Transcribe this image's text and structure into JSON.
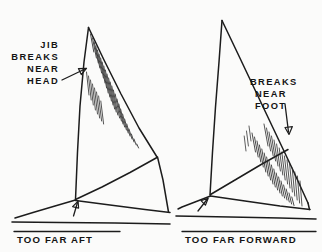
{
  "figure": {
    "background_color": "#fbfbfa",
    "ink_color": "#1c1c1c",
    "style": "hand-drawn line illustration"
  },
  "panels": [
    {
      "id": "left",
      "caption": "TOO FAR AFT",
      "callout_lines": [
        "JIB",
        "BREAKS",
        "NEAR",
        "HEAD"
      ],
      "callout_text": "JIB BREAKS NEAR HEAD",
      "break_location": "head",
      "hatch_region": "upper luff near head",
      "arrow": "callout arrow pointing right-down to upper luff",
      "caption_arrow": "arrow pointing up-right to tack"
    },
    {
      "id": "right",
      "caption": "TOO FAR FORWARD",
      "callout_lines": [
        "BREAKS",
        "NEAR",
        "FOOT"
      ],
      "callout_text": "BREAKS NEAR FOOT",
      "break_location": "foot",
      "hatch_region": "lower leech near foot",
      "arrow": "callout arrow pointing down to lower leech",
      "caption_arrow": "arrow pointing up-right to tack"
    }
  ],
  "captions": {
    "left": "TOO FAR AFT",
    "right": "TOO FAR FORWARD"
  },
  "callouts": {
    "left": {
      "line1": "JIB",
      "line2": "BREAKS",
      "line3": "NEAR",
      "line4": "HEAD"
    },
    "right": {
      "line1": "BREAKS",
      "line2": "NEAR",
      "line3": "FOOT"
    }
  }
}
